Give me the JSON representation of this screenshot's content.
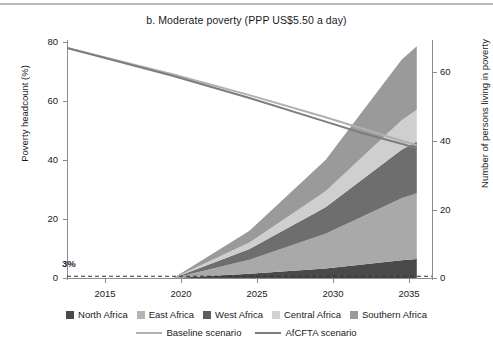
{
  "chart_data": {
    "type": "area",
    "title": "b. Moderate poverty (PPP US$5.50 a day)",
    "xlabel": "",
    "ylabel": "Poverty headcount (%)",
    "ylabel_right": "Number of persons living in poverty",
    "grid": false,
    "legend_position": "bottom",
    "x": [
      2015,
      2020,
      2025,
      2030,
      2035,
      2036
    ],
    "xlim": [
      2013,
      2037
    ],
    "xticks": [
      2015,
      2020,
      2025,
      2030,
      2035
    ],
    "xtick_labels": [
      "2015",
      "2020",
      "2025",
      "2030",
      "2035"
    ],
    "ylim": [
      0,
      80
    ],
    "yticks": [
      0,
      20,
      40,
      60,
      80
    ],
    "ytick_labels": [
      "0",
      "20",
      "40",
      "60",
      "80"
    ],
    "ylim_right": [
      0,
      70
    ],
    "yticks_right": [
      0,
      20,
      40,
      60
    ],
    "ytick_labels_right": [
      "0",
      "20",
      "40",
      "60"
    ],
    "annotations": [
      {
        "text": "3%",
        "x": 2014.4,
        "y": 5.5
      }
    ],
    "reference_line": {
      "label": "3%",
      "value": 0.6,
      "style": "dashed"
    },
    "stacked_series": [
      {
        "name": "North Africa",
        "color": "#4a4a4a",
        "values": [
          0,
          0,
          1.4,
          3.2,
          6.0,
          6.4
        ]
      },
      {
        "name": "East Africa",
        "color": "#a9a9a9",
        "values": [
          0,
          0,
          4.8,
          11.8,
          21.0,
          22.3
        ]
      },
      {
        "name": "West Africa",
        "color": "#6e6e6e",
        "values": [
          0,
          0,
          3.6,
          9.0,
          16.5,
          17.6
        ]
      },
      {
        "name": "Central Africa",
        "color": "#cfcfcf",
        "values": [
          0,
          0,
          2.2,
          5.4,
          10.0,
          10.7
        ]
      },
      {
        "name": "Southern Africa",
        "color": "#9a9a9a",
        "values": [
          0,
          0,
          4.0,
          10.6,
          20.5,
          21.6
        ]
      }
    ],
    "line_series": [
      {
        "name": "Baseline scenario",
        "color": "#b0b0b0",
        "values_at": [
          [
            2013,
            78.0
          ],
          [
            2020,
            69.0
          ],
          [
            2025,
            62.0
          ],
          [
            2030,
            54.5
          ],
          [
            2032.5,
            50.5
          ],
          [
            2035,
            46.5
          ],
          [
            2036,
            45.0
          ]
        ]
      },
      {
        "name": "AfCFTA scenario",
        "color": "#7d7d7d",
        "values_at": [
          [
            2013,
            78.0
          ],
          [
            2020,
            68.5
          ],
          [
            2025,
            61.0
          ],
          [
            2030,
            53.0
          ],
          [
            2032.5,
            49.0
          ],
          [
            2035,
            45.5
          ],
          [
            2036,
            44.0
          ]
        ]
      }
    ],
    "legend_swatches": [
      {
        "label": "North Africa",
        "color": "#4a4a4a"
      },
      {
        "label": "East Africa",
        "color": "#b4b4b4"
      },
      {
        "label": "West Africa",
        "color": "#5e5e5e"
      },
      {
        "label": "Central Africa",
        "color": "#d2d2d2"
      },
      {
        "label": "Southern Africa",
        "color": "#9a9a9a"
      }
    ],
    "legend_lines": [
      {
        "label": "Baseline scenario",
        "color": "#b0b0b0"
      },
      {
        "label": "AfCFTA scenario",
        "color": "#7d7d7d"
      }
    ]
  }
}
